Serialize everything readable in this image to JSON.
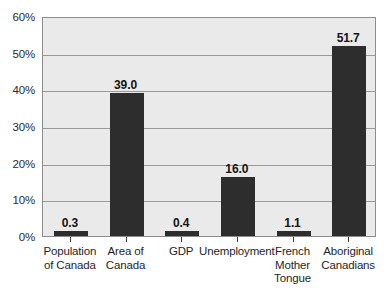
{
  "chart_data": {
    "type": "bar",
    "title": "",
    "subtitle": "",
    "xlabel": "",
    "ylabel": "",
    "categories": [
      "Population\nof Canada",
      "Area of\nCanada",
      "GDP",
      "Unemployment",
      "French\nMother\nTongue",
      "Aboriginal\nCanadians"
    ],
    "values": [
      0.3,
      39.0,
      0.4,
      16.0,
      1.1,
      51.7
    ],
    "value_labels": [
      "0.3",
      "39.0",
      "0.4",
      "16.0",
      "1.1",
      "51.7"
    ],
    "ylim": [
      0,
      60
    ],
    "yticks": [
      0,
      10,
      20,
      30,
      40,
      50,
      60
    ],
    "ytick_labels": [
      "0%",
      "10%",
      "20%",
      "30%",
      "40%",
      "50%",
      "60%"
    ],
    "grid": true,
    "legend": "none",
    "bar_color": "#2d2d2d",
    "plot_background": "#eaeaea",
    "grid_color": "#9a9a9a",
    "axis_color": "#8c8c8c",
    "page_background": "#ffffff"
  }
}
